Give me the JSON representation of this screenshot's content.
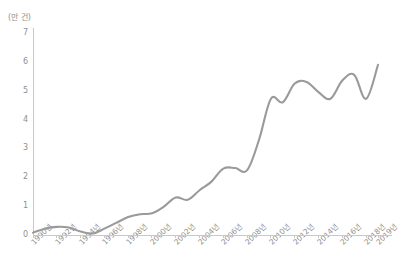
{
  "chart_data": {
    "type": "line",
    "title": "",
    "subtitle": "",
    "xlabel": "",
    "ylabel": "(만 건)",
    "unit_label": "(만 건)",
    "ylim": [
      0,
      7
    ],
    "xlim": [
      1990,
      2019
    ],
    "grid": false,
    "legend": null,
    "legend_position": "none",
    "y_ticks": [
      "0",
      "1",
      "2",
      "3",
      "4",
      "5",
      "6",
      "7"
    ],
    "y_tick_values": [
      0,
      1,
      2,
      3,
      4,
      5,
      6,
      7
    ],
    "x_tick_labels": [
      "1990년",
      "1992년",
      "1994년",
      "1996년",
      "1998년",
      "2000년",
      "2002년",
      "2004년",
      "2006년",
      "2008년",
      "2010년",
      "2012년",
      "2014년",
      "2016년",
      "2018년",
      "2019년"
    ],
    "x_tick_values": [
      1990,
      1992,
      1994,
      1996,
      1998,
      2000,
      2002,
      2004,
      2006,
      2008,
      2010,
      2012,
      2014,
      2016,
      2018,
      2019
    ],
    "x": [
      1990,
      1991,
      1992,
      1993,
      1994,
      1995,
      1996,
      1997,
      1998,
      1999,
      2000,
      2001,
      2002,
      2003,
      2004,
      2005,
      2006,
      2007,
      2008,
      2009,
      2010,
      2011,
      2012,
      2013,
      2014,
      2015,
      2016,
      2017,
      2018,
      2019
    ],
    "series": [
      {
        "name": "건수",
        "color": "#9a9a9a",
        "values": [
          0.08,
          0.22,
          0.28,
          0.26,
          0.12,
          0.05,
          0.22,
          0.42,
          0.62,
          0.72,
          0.75,
          0.98,
          1.3,
          1.22,
          1.55,
          1.85,
          2.3,
          2.32,
          2.25,
          3.3,
          4.72,
          4.6,
          5.25,
          5.3,
          4.95,
          4.72,
          5.35,
          5.55,
          4.72,
          5.9
        ]
      }
    ],
    "line_color": "#9a9a9a",
    "axis_color": "#c8c8c8",
    "text_color": "#8f8f8f",
    "background_color": "#ffffff"
  },
  "footer": {
    "caption": ""
  }
}
